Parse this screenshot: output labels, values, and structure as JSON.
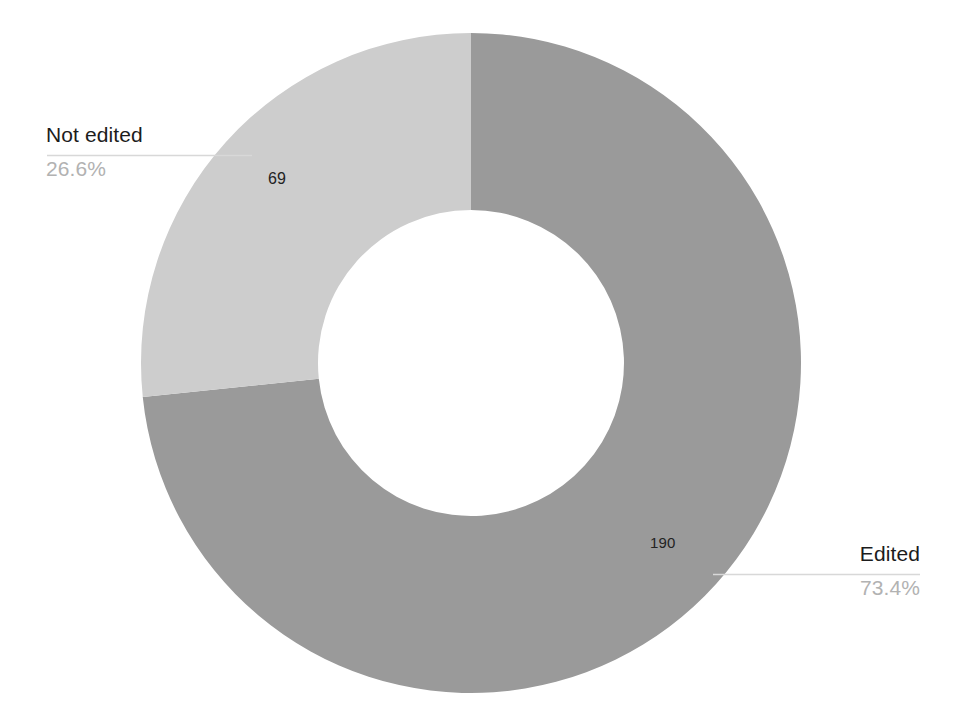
{
  "chart_data": {
    "type": "pie",
    "variant": "donut",
    "title": "",
    "subtitle": "",
    "xlabel": "",
    "ylabel": "",
    "grid": false,
    "legend_position": "callout-labels",
    "total": 259,
    "start_angle_deg": 90,
    "direction": "counterclockwise-for-first-slice",
    "categories": [
      "Edited",
      "Not edited"
    ],
    "values": [
      190,
      69
    ],
    "percentages": [
      "73.4%",
      "26.6%"
    ],
    "value_labels": [
      "190",
      "69"
    ],
    "colors": [
      "#9a9a9a",
      "#cdcdcd"
    ],
    "series": [
      {
        "name": "Documents",
        "values": [
          190,
          69
        ]
      }
    ],
    "slices": [
      {
        "label": "Edited",
        "value": 190,
        "value_label": "190",
        "percent_label": "73.4%",
        "percent": 73.4,
        "color": "#9a9a9a"
      },
      {
        "label": "Not edited",
        "value": 69,
        "value_label": "69",
        "percent_label": "26.6%",
        "percent": 26.6,
        "color": "#cdcdcd"
      }
    ]
  },
  "geometry": {
    "center_x": 471,
    "center_y": 363,
    "outer_radius": 330,
    "inner_radius": 153
  },
  "callouts": {
    "not_edited": {
      "name": "Not edited",
      "percent": "26.6%"
    },
    "edited": {
      "name": "Edited",
      "percent": "73.4%"
    }
  },
  "colors": {
    "slice_dark": "#9a9a9a",
    "slice_light": "#cdcdcd",
    "leader_line": "#d8d8d8",
    "label_text": "#1c1c1c",
    "percent_text": "#b2b2b2",
    "value_text": "#232323",
    "background": "#ffffff"
  }
}
